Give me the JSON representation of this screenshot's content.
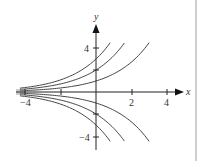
{
  "figure": {
    "x_axis_label": "x",
    "y_axis_label": "y",
    "x_tick_labels": [
      "−4",
      "2",
      "4"
    ],
    "y_tick_labels": [
      "4",
      "−4"
    ],
    "colors": {
      "axis": "#222222",
      "curve": "#444444",
      "background": "#ffffff",
      "side_rule": "#cfcfcf"
    }
  },
  "chart_data": {
    "type": "line",
    "title": "",
    "xlabel": "x",
    "ylabel": "y",
    "xlim": [
      -4.3,
      5
    ],
    "ylim": [
      -5,
      6
    ],
    "grid": false,
    "x_ticks": [
      -4,
      -2,
      2,
      4
    ],
    "x_tick_labels": [
      "−4",
      "",
      "2",
      "4"
    ],
    "y_ticks": [
      -4,
      -2,
      2,
      4
    ],
    "y_tick_labels": [
      "−4",
      "",
      "",
      "4"
    ],
    "series": [
      {
        "name": "C=3",
        "C": 3,
        "x": [
          -4,
          -2,
          0,
          0.8
        ],
        "y": [
          0.41,
          1.1,
          3.0,
          4.45
        ]
      },
      {
        "name": "C=2",
        "C": 2,
        "x": [
          -4,
          -2,
          0,
          1.6
        ],
        "y": [
          0.27,
          0.74,
          2.0,
          4.45
        ]
      },
      {
        "name": "C=1",
        "C": 1,
        "x": [
          -4,
          -2,
          0,
          3.0
        ],
        "y": [
          0.14,
          0.37,
          1.0,
          4.45
        ]
      },
      {
        "name": "C=0",
        "C": 0,
        "x": [
          -4,
          4.5
        ],
        "y": [
          0,
          0
        ]
      },
      {
        "name": "C=-1",
        "C": -1,
        "x": [
          -4,
          -2,
          0,
          3.0
        ],
        "y": [
          -0.14,
          -0.37,
          -1.0,
          -4.45
        ]
      },
      {
        "name": "C=-2",
        "C": -2,
        "x": [
          -4,
          -2,
          0,
          1.6
        ],
        "y": [
          -0.27,
          -0.74,
          -2.0,
          -4.45
        ]
      },
      {
        "name": "C=-3",
        "C": -3,
        "x": [
          -4,
          -2,
          0,
          0.8
        ],
        "y": [
          -0.41,
          -1.1,
          -3.0,
          -4.45
        ]
      }
    ]
  }
}
